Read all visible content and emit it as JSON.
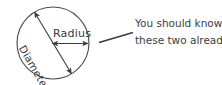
{
  "figure": {
    "background_color": "#ffffff",
    "ink_color": "#3a3a3a",
    "circle": {
      "center_x": 53,
      "center_y": 43,
      "radius": 36
    },
    "labels": {
      "radius": "Radius",
      "diameter": "Diameter"
    },
    "annotation": {
      "line1": "You should know",
      "line2": "these two already."
    }
  }
}
